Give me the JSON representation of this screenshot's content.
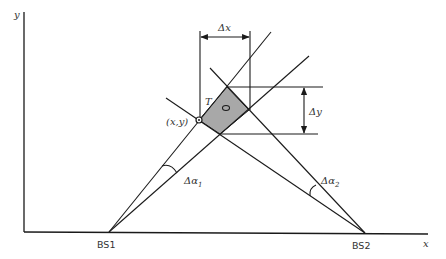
{
  "diagram": {
    "axes": {
      "x_label": "x",
      "y_label": "y"
    },
    "stations": [
      {
        "label": "BS1",
        "position": [
          109,
          232
        ]
      },
      {
        "label": "BS2",
        "position": [
          365,
          233
        ]
      }
    ],
    "point_label": "(x,y)",
    "target_label": "T",
    "delta_x_label": "Δx",
    "delta_y_label": "Δy",
    "angle_labels": {
      "alpha1_prefix": "Δα",
      "alpha1_sub": "1",
      "alpha2_prefix": "Δα",
      "alpha2_sub": "2"
    },
    "colors": {
      "line": "#1a1a1a",
      "shaded_region": "#a8a8a8",
      "text": "#333333",
      "background": "#ffffff"
    }
  }
}
